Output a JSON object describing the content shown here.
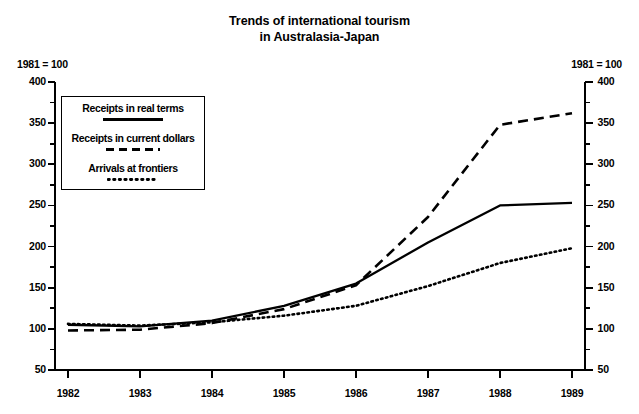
{
  "title": {
    "line1": "Trends of international tourism",
    "line2": "in Australasia-Japan"
  },
  "axis_note": {
    "left": "1981 = 100",
    "right": "1981 = 100"
  },
  "legend": {
    "items": [
      {
        "label": "Receipts in real terms",
        "style": "solid",
        "key": "receipts_real"
      },
      {
        "label": "Receipts in current dollars",
        "style": "dashed",
        "key": "receipts_current"
      },
      {
        "label": "Arrivals at frontiers",
        "style": "dotted",
        "key": "arrivals"
      }
    ]
  },
  "chart_data": {
    "type": "line",
    "title": "Trends of international tourism in Australasia-Japan",
    "xlabel": "",
    "ylabel": "1981 = 100",
    "x": [
      1982,
      1983,
      1984,
      1985,
      1986,
      1987,
      1988,
      1989
    ],
    "categories": [
      "1982",
      "1983",
      "1984",
      "1985",
      "1986",
      "1987",
      "1988",
      "1989"
    ],
    "xlim": [
      1982,
      1989
    ],
    "ylim": [
      50,
      400
    ],
    "yticks": [
      50,
      100,
      150,
      200,
      250,
      300,
      350,
      400
    ],
    "yticks_minor": [
      75,
      125,
      175,
      225,
      275,
      325,
      375
    ],
    "ytick_labels": [
      "50",
      "100",
      "150",
      "200",
      "250",
      "300",
      "350",
      "400"
    ],
    "xticks": [
      1982,
      1983,
      1984,
      1985,
      1986,
      1987,
      1988,
      1989
    ],
    "xtick_labels": [
      "1982",
      "1983",
      "1984",
      "1985",
      "1986",
      "1987",
      "1988",
      "1989"
    ],
    "grid": false,
    "legend_position": "upper-left",
    "dual_y_axis": true,
    "series": [
      {
        "name": "Receipts in real terms",
        "style": "solid",
        "values": [
          105,
          103,
          110,
          128,
          155,
          205,
          250,
          253
        ]
      },
      {
        "name": "Receipts in current dollars",
        "style": "dashed",
        "values": [
          98,
          99,
          107,
          124,
          153,
          236,
          348,
          362
        ]
      },
      {
        "name": "Arrivals at frontiers",
        "style": "dotted",
        "values": [
          106,
          104,
          108,
          116,
          128,
          152,
          180,
          198
        ]
      }
    ]
  }
}
